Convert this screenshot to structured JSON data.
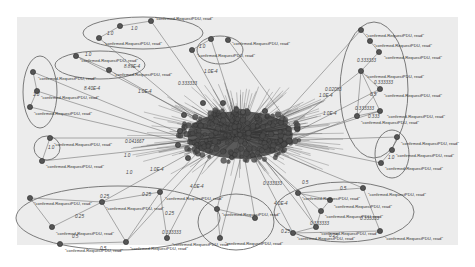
{
  "figure": {
    "background": "#ececec",
    "page_background": "#ffffff",
    "panel": {
      "x": 17,
      "y": 17,
      "w": 441,
      "h": 228
    },
    "node_label_text": "\"confirmed-RequestPDU, read\"",
    "hub": {
      "cx": 240,
      "cy": 135,
      "rx": 62,
      "ry": 28,
      "color": "#2a2a2a"
    }
  },
  "clusters": [
    {
      "id": "top-center",
      "ellipse": {
        "cx": 143,
        "cy": 33,
        "rx": 60,
        "ry": 16
      }
    },
    {
      "id": "top-right-small",
      "ellipse": {
        "cx": 220,
        "cy": 50,
        "rx": 23,
        "ry": 14
      }
    },
    {
      "id": "upper-left-wide",
      "ellipse": {
        "cx": 100,
        "cy": 65,
        "rx": 45,
        "ry": 14
      }
    },
    {
      "id": "left-tall",
      "ellipse": {
        "cx": 40,
        "cy": 92,
        "rx": 17,
        "ry": 36
      }
    },
    {
      "id": "right-tall",
      "ellipse": {
        "cx": 374,
        "cy": 90,
        "rx": 34,
        "ry": 68
      }
    },
    {
      "id": "left-small",
      "ellipse": {
        "cx": 47,
        "cy": 148,
        "rx": 13,
        "ry": 12
      }
    },
    {
      "id": "right-small",
      "ellipse": {
        "cx": 392,
        "cy": 154,
        "rx": 17,
        "ry": 24
      }
    },
    {
      "id": "bottom-left",
      "ellipse": {
        "cx": 118,
        "cy": 218,
        "rx": 102,
        "ry": 32
      }
    },
    {
      "id": "bottom-mid",
      "ellipse": {
        "cx": 236,
        "cy": 222,
        "rx": 38,
        "ry": 28
      }
    },
    {
      "id": "bottom-right",
      "ellipse": {
        "cx": 344,
        "cy": 212,
        "rx": 70,
        "ry": 30
      }
    }
  ],
  "nodes": [
    {
      "x": 151,
      "y": 21,
      "label": "\"confirmed-RequestPDU, read\"",
      "lx": 155,
      "ly": 20
    },
    {
      "x": 120,
      "y": 26,
      "label": "",
      "lx": 0,
      "ly": 0
    },
    {
      "x": 99,
      "y": 38,
      "label": "\"confirmed-RequestPDU, read\"",
      "lx": 104,
      "ly": 45
    },
    {
      "x": 211,
      "y": 39,
      "label": "",
      "lx": 0,
      "ly": 0
    },
    {
      "x": 192,
      "y": 50,
      "label": "\"confirmed-RequestPDU, read\"",
      "lx": 197,
      "ly": 57
    },
    {
      "x": 228,
      "y": 40,
      "label": "\"confirmed-RequestPDU, read\"",
      "lx": 232,
      "ly": 45
    },
    {
      "x": 76,
      "y": 56,
      "label": "\"confirmed-RequestPDU, read\"",
      "lx": 80,
      "ly": 62
    },
    {
      "x": 109,
      "y": 70,
      "label": "\"confirmed-RequestPDU, read\"",
      "lx": 114,
      "ly": 76
    },
    {
      "x": 33,
      "y": 72,
      "label": "\"confirmed-RequestPDU, read\"",
      "lx": 38,
      "ly": 80
    },
    {
      "x": 37,
      "y": 91,
      "label": "\"confirmed-RequestPDU, read\"",
      "lx": 41,
      "ly": 99
    },
    {
      "x": 30,
      "y": 107,
      "label": "\"confirmed-RequestPDU, read\"",
      "lx": 34,
      "ly": 115
    },
    {
      "x": 361,
      "y": 30,
      "label": "\"confirmed-RequestPDU, read\"",
      "lx": 366,
      "ly": 37
    },
    {
      "x": 370,
      "y": 41,
      "label": "\"confirmed-RequestPDU, read\"",
      "lx": 374,
      "ly": 47
    },
    {
      "x": 379,
      "y": 52,
      "label": "\"confirmed-RequestPDU, read\"",
      "lx": 384,
      "ly": 59
    },
    {
      "x": 361,
      "y": 71,
      "label": "\"confirmed-RequestPDU, read\"",
      "lx": 366,
      "ly": 78
    },
    {
      "x": 380,
      "y": 89,
      "label": "\"confirmed-RequestPDU, read\"",
      "lx": 384,
      "ly": 97
    },
    {
      "x": 380,
      "y": 111,
      "label": "\"confirmed-RequestPDU, read\"",
      "lx": 387,
      "ly": 118
    },
    {
      "x": 357,
      "y": 116,
      "label": "\"confirmed-RequestPDU, read\"",
      "lx": 361,
      "ly": 124
    },
    {
      "x": 50,
      "y": 138,
      "label": "\"confirmed-RequestPDU, read\"",
      "lx": 54,
      "ly": 146
    },
    {
      "x": 42,
      "y": 161,
      "label": "\"confirmed-RequestPDU, read\"",
      "lx": 46,
      "ly": 168
    },
    {
      "x": 397,
      "y": 137,
      "label": "\"confirmed-RequestPDU, read\"",
      "lx": 401,
      "ly": 145
    },
    {
      "x": 392,
      "y": 150,
      "label": "\"confirmed-RequestPDU, read\"",
      "lx": 396,
      "ly": 157
    },
    {
      "x": 381,
      "y": 163,
      "label": "\"confirmed-RequestPDU, read\"",
      "lx": 385,
      "ly": 170
    },
    {
      "x": 30,
      "y": 198,
      "label": "\"confirmed-RequestPDU, read\"",
      "lx": 34,
      "ly": 205
    },
    {
      "x": 102,
      "y": 202,
      "label": "\"confirmed-RequestPDU, read\"",
      "lx": 106,
      "ly": 210
    },
    {
      "x": 52,
      "y": 227,
      "label": "\"confirmed-RequestPDU, read\"",
      "lx": 56,
      "ly": 235
    },
    {
      "x": 160,
      "y": 192,
      "label": "\"confirmed-RequestPDU, read\"",
      "lx": 165,
      "ly": 200
    },
    {
      "x": 60,
      "y": 244,
      "label": "\"confirmed-RequestPDU, read\"",
      "lx": 65,
      "ly": 252
    },
    {
      "x": 126,
      "y": 242,
      "label": "\"confirmed-RequestPDU, read\"",
      "lx": 130,
      "ly": 250
    },
    {
      "x": 167,
      "y": 238,
      "label": "\"confirmed-RequestPDU, read\"",
      "lx": 172,
      "ly": 246
    },
    {
      "x": 217,
      "y": 209,
      "label": "\"confirmed-RequestPDU, read\"",
      "lx": 222,
      "ly": 216
    },
    {
      "x": 220,
      "y": 238,
      "label": "\"confirmed-RequestPDU, read\"",
      "lx": 225,
      "ly": 245
    },
    {
      "x": 255,
      "y": 218,
      "label": "",
      "lx": 0,
      "ly": 0
    },
    {
      "x": 298,
      "y": 193,
      "label": "\"confirmed-RequestPDU, read\"",
      "lx": 302,
      "ly": 200
    },
    {
      "x": 330,
      "y": 200,
      "label": "\"confirmed-RequestPDU, read\"",
      "lx": 334,
      "ly": 208
    },
    {
      "x": 321,
      "y": 211,
      "label": "\"confirmed-RequestPDU, read\"",
      "lx": 325,
      "ly": 218
    },
    {
      "x": 316,
      "y": 227,
      "label": "\"confirmed-RequestPDU, read\"",
      "lx": 320,
      "ly": 235
    },
    {
      "x": 293,
      "y": 233,
      "label": "\"confirmed-RequestPDU, read\"",
      "lx": 297,
      "ly": 240
    },
    {
      "x": 363,
      "y": 188,
      "label": "\"confirmed-RequestPDU, read\"",
      "lx": 368,
      "ly": 196
    },
    {
      "x": 380,
      "y": 231,
      "label": "\"confirmed-RequestPDU, read\"",
      "lx": 385,
      "ly": 240
    },
    {
      "x": 203,
      "y": 103,
      "label": "",
      "lx": 0,
      "ly": 0
    },
    {
      "x": 223,
      "y": 103,
      "label": "",
      "lx": 0,
      "ly": 0
    },
    {
      "x": 243,
      "y": 112,
      "label": "",
      "lx": 0,
      "ly": 0
    },
    {
      "x": 265,
      "y": 111,
      "label": "",
      "lx": 0,
      "ly": 0
    },
    {
      "x": 184,
      "y": 115,
      "label": "",
      "lx": 0,
      "ly": 0
    },
    {
      "x": 180,
      "y": 131,
      "label": "",
      "lx": 0,
      "ly": 0
    },
    {
      "x": 178,
      "y": 145,
      "label": "",
      "lx": 0,
      "ly": 0
    },
    {
      "x": 188,
      "y": 158,
      "label": "",
      "lx": 0,
      "ly": 0
    }
  ],
  "edge_labels": [
    {
      "x": 131,
      "y": 30,
      "text": "1.0"
    },
    {
      "x": 107,
      "y": 35,
      "text": "1.0"
    },
    {
      "x": 199,
      "y": 48,
      "text": "1.0"
    },
    {
      "x": 85,
      "y": 56,
      "text": "1.0"
    },
    {
      "x": 124,
      "y": 68,
      "text": "8.89E-4"
    },
    {
      "x": 84,
      "y": 90,
      "text": "8.40E-4"
    },
    {
      "x": 138,
      "y": 93,
      "text": "1.0E-4"
    },
    {
      "x": 204,
      "y": 73,
      "text": "1.0E-4"
    },
    {
      "x": 178,
      "y": 85,
      "text": "0.333333"
    },
    {
      "x": 125,
      "y": 143,
      "text": "0.041667"
    },
    {
      "x": 124,
      "y": 157,
      "text": "1.0"
    },
    {
      "x": 33,
      "y": 96,
      "text": "1.0"
    },
    {
      "x": 48,
      "y": 149,
      "text": "1.0"
    },
    {
      "x": 126,
      "y": 174,
      "text": "1.0"
    },
    {
      "x": 150,
      "y": 171,
      "text": "1.0E-4"
    },
    {
      "x": 100,
      "y": 198,
      "text": "0.25"
    },
    {
      "x": 142,
      "y": 196,
      "text": "0.25"
    },
    {
      "x": 75,
      "y": 218,
      "text": "0.25"
    },
    {
      "x": 165,
      "y": 215,
      "text": "0.25"
    },
    {
      "x": 162,
      "y": 234,
      "text": "0.333333"
    },
    {
      "x": 72,
      "y": 238,
      "text": "0.5"
    },
    {
      "x": 100,
      "y": 250,
      "text": "0.5"
    },
    {
      "x": 190,
      "y": 188,
      "text": "4.0E-4"
    },
    {
      "x": 357,
      "y": 62,
      "text": "0.333333"
    },
    {
      "x": 374,
      "y": 84,
      "text": "0.333333"
    },
    {
      "x": 370,
      "y": 96,
      "text": "0.5"
    },
    {
      "x": 355,
      "y": 110,
      "text": "0.333333"
    },
    {
      "x": 368,
      "y": 118,
      "text": "0.333"
    },
    {
      "x": 325,
      "y": 91,
      "text": "0.02083"
    },
    {
      "x": 319,
      "y": 97,
      "text": "1.0E-4"
    },
    {
      "x": 323,
      "y": 115,
      "text": "1.0E-4"
    },
    {
      "x": 388,
      "y": 159,
      "text": "1.0"
    },
    {
      "x": 302,
      "y": 184,
      "text": "0.5"
    },
    {
      "x": 263,
      "y": 185,
      "text": "0.333333"
    },
    {
      "x": 340,
      "y": 190,
      "text": "0.5"
    },
    {
      "x": 274,
      "y": 205,
      "text": "4.0E-4"
    },
    {
      "x": 310,
      "y": 225,
      "text": "0.333333"
    },
    {
      "x": 360,
      "y": 220,
      "text": "0.333333"
    },
    {
      "x": 329,
      "y": 237,
      "text": "0.25"
    },
    {
      "x": 281,
      "y": 233,
      "text": "0.25"
    }
  ],
  "edges": [
    [
      151,
      21,
      120,
      26
    ],
    [
      120,
      26,
      99,
      38
    ],
    [
      151,
      21,
      228,
      130
    ],
    [
      99,
      38,
      215,
      135
    ],
    [
      211,
      39,
      192,
      50
    ],
    [
      211,
      39,
      240,
      130
    ],
    [
      228,
      40,
      290,
      125
    ],
    [
      192,
      50,
      235,
      130
    ],
    [
      76,
      56,
      109,
      70
    ],
    [
      76,
      56,
      200,
      120
    ],
    [
      109,
      70,
      205,
      125
    ],
    [
      33,
      72,
      37,
      91
    ],
    [
      37,
      91,
      30,
      107
    ],
    [
      33,
      72,
      185,
      135
    ],
    [
      37,
      91,
      190,
      140
    ],
    [
      30,
      107,
      195,
      145
    ],
    [
      361,
      30,
      370,
      41
    ],
    [
      370,
      41,
      379,
      52
    ],
    [
      379,
      52,
      361,
      71
    ],
    [
      361,
      71,
      380,
      89
    ],
    [
      361,
      71,
      357,
      116
    ],
    [
      361,
      71,
      380,
      111
    ],
    [
      380,
      89,
      357,
      116
    ],
    [
      357,
      116,
      380,
      111
    ],
    [
      361,
      30,
      275,
      125
    ],
    [
      361,
      71,
      285,
      130
    ],
    [
      380,
      89,
      290,
      135
    ],
    [
      380,
      111,
      295,
      138
    ],
    [
      357,
      116,
      290,
      142
    ],
    [
      50,
      138,
      42,
      161
    ],
    [
      50,
      138,
      185,
      138
    ],
    [
      42,
      161,
      190,
      145
    ],
    [
      397,
      137,
      392,
      150
    ],
    [
      392,
      150,
      381,
      163
    ],
    [
      397,
      137,
      300,
      140
    ],
    [
      381,
      163,
      295,
      145
    ],
    [
      30,
      198,
      52,
      227
    ],
    [
      30,
      198,
      102,
      202
    ],
    [
      102,
      202,
      126,
      242
    ],
    [
      102,
      202,
      160,
      192
    ],
    [
      52,
      227,
      102,
      202
    ],
    [
      60,
      244,
      126,
      242
    ],
    [
      126,
      242,
      160,
      192
    ],
    [
      160,
      192,
      167,
      238
    ],
    [
      160,
      192,
      200,
      150
    ],
    [
      126,
      242,
      205,
      155
    ],
    [
      102,
      202,
      195,
      150
    ],
    [
      167,
      238,
      210,
      155
    ],
    [
      217,
      209,
      220,
      238
    ],
    [
      217,
      209,
      255,
      218
    ],
    [
      217,
      209,
      230,
      155
    ],
    [
      220,
      238,
      240,
      160
    ],
    [
      255,
      218,
      245,
      160
    ],
    [
      298,
      193,
      330,
      200
    ],
    [
      298,
      193,
      363,
      188
    ],
    [
      298,
      193,
      316,
      227
    ],
    [
      330,
      200,
      321,
      211
    ],
    [
      321,
      211,
      316,
      227
    ],
    [
      316,
      227,
      293,
      233
    ],
    [
      293,
      233,
      380,
      231
    ],
    [
      363,
      188,
      380,
      231
    ],
    [
      298,
      193,
      260,
      155
    ],
    [
      363,
      188,
      270,
      150
    ],
    [
      316,
      227,
      265,
      160
    ],
    [
      293,
      233,
      255,
      160
    ],
    [
      321,
      211,
      262,
      158
    ]
  ],
  "hub_spokes": 160
}
